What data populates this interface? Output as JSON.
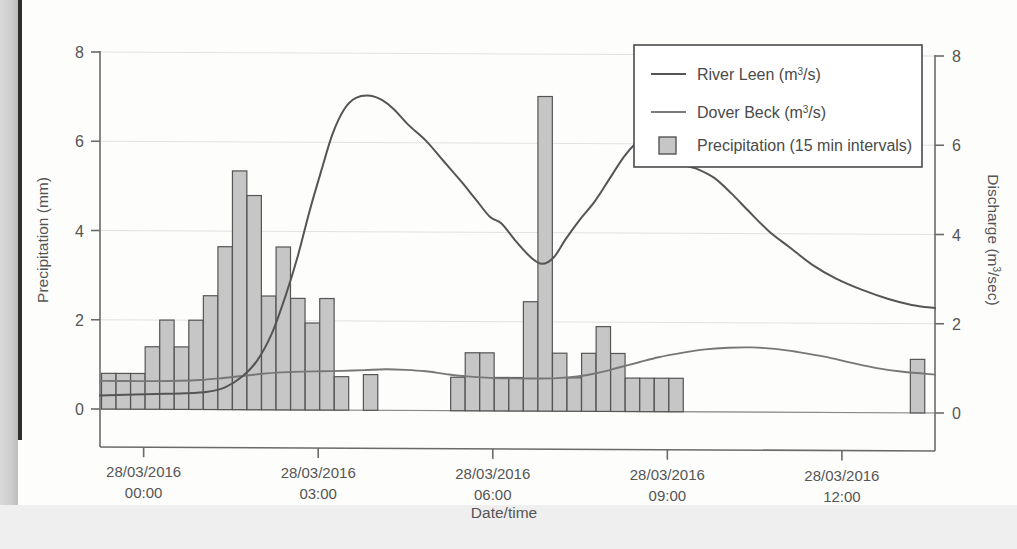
{
  "figure": {
    "name": "hydrograph-precipitation-discharge",
    "background_color": "#fdfdfc"
  },
  "chart_data": {
    "type": "bar",
    "title": "",
    "subtitle": "",
    "xlabel": "Date/time",
    "ylabel": "Precipitation (mm)",
    "y2label": "Discharge (m3/sec)",
    "ylim": [
      0,
      8
    ],
    "y2lim": [
      0,
      8
    ],
    "yticks": [
      "0",
      "2",
      "4",
      "6",
      "8"
    ],
    "y2ticks": [
      "0",
      "2",
      "4",
      "6",
      "8"
    ],
    "grid": true,
    "legend_position": "top-right",
    "xtick_labels": [
      {
        "date": "28/03/2016",
        "time": "00:00"
      },
      {
        "date": "28/03/2016",
        "time": "03:00"
      },
      {
        "date": "28/03/2016",
        "time": "06:00"
      },
      {
        "date": "28/03/2016",
        "time": "09:00"
      },
      {
        "date": "28/03/2016",
        "time": "12:00"
      }
    ],
    "xlim_hours": [
      -0.75,
      13.6
    ],
    "legend": [
      {
        "label": "River Leen (m3/s)",
        "label_pre": "River Leen (m",
        "label_sup": "3",
        "label_post": "/s)",
        "type": "line",
        "color": "#555555"
      },
      {
        "label": "Dover Beck (m3/s)",
        "label_pre": "Dover Beck (m",
        "label_sup": "3",
        "label_post": "/s)",
        "type": "line",
        "color": "#777777"
      },
      {
        "label": "Precipitation (15 min intervals)",
        "label_pre": "Precipitation (15 min intervals)",
        "label_sup": "",
        "label_post": "",
        "type": "bar",
        "color": "#c2c2c2"
      }
    ],
    "series": [
      {
        "name": "Precipitation (15 min intervals)",
        "units": "mm",
        "interval_minutes": 15,
        "type": "bar",
        "color": "#c6c6c6",
        "edge_color": "#555555",
        "points": [
          {
            "x": -0.6,
            "y": 0.8
          },
          {
            "x": -0.35,
            "y": 0.8
          },
          {
            "x": -0.1,
            "y": 0.8
          },
          {
            "x": 0.15,
            "y": 1.4
          },
          {
            "x": 0.4,
            "y": 2.0
          },
          {
            "x": 0.65,
            "y": 1.4
          },
          {
            "x": 0.9,
            "y": 2.0
          },
          {
            "x": 1.15,
            "y": 2.55
          },
          {
            "x": 1.4,
            "y": 3.65
          },
          {
            "x": 1.65,
            "y": 5.35
          },
          {
            "x": 1.9,
            "y": 4.8
          },
          {
            "x": 2.15,
            "y": 2.55
          },
          {
            "x": 2.4,
            "y": 3.65
          },
          {
            "x": 2.65,
            "y": 2.5
          },
          {
            "x": 2.9,
            "y": 1.95
          },
          {
            "x": 3.15,
            "y": 2.5
          },
          {
            "x": 3.4,
            "y": 0.75
          },
          {
            "x": 3.9,
            "y": 0.8
          },
          {
            "x": 5.4,
            "y": 0.75
          },
          {
            "x": 5.65,
            "y": 1.3
          },
          {
            "x": 5.9,
            "y": 1.3
          },
          {
            "x": 6.15,
            "y": 0.75
          },
          {
            "x": 6.4,
            "y": 0.75
          },
          {
            "x": 6.65,
            "y": 2.45
          },
          {
            "x": 6.9,
            "y": 7.05
          },
          {
            "x": 7.15,
            "y": 1.3
          },
          {
            "x": 7.4,
            "y": 0.75
          },
          {
            "x": 7.65,
            "y": 1.3
          },
          {
            "x": 7.9,
            "y": 1.9
          },
          {
            "x": 8.15,
            "y": 1.3
          },
          {
            "x": 8.4,
            "y": 0.75
          },
          {
            "x": 8.65,
            "y": 0.75
          },
          {
            "x": 8.9,
            "y": 0.75
          },
          {
            "x": 9.15,
            "y": 0.75
          },
          {
            "x": 13.3,
            "y": 1.2
          }
        ]
      },
      {
        "name": "River Leen (m3/s)",
        "units": "m3/s",
        "type": "line",
        "color": "#555555",
        "points": [
          {
            "x": -0.75,
            "y": 0.3
          },
          {
            "x": -0.3,
            "y": 0.32
          },
          {
            "x": 0.2,
            "y": 0.34
          },
          {
            "x": 0.7,
            "y": 0.36
          },
          {
            "x": 1.1,
            "y": 0.4
          },
          {
            "x": 1.4,
            "y": 0.5
          },
          {
            "x": 1.7,
            "y": 0.75
          },
          {
            "x": 1.95,
            "y": 1.1
          },
          {
            "x": 2.2,
            "y": 1.7
          },
          {
            "x": 2.45,
            "y": 2.6
          },
          {
            "x": 2.65,
            "y": 3.45
          },
          {
            "x": 2.85,
            "y": 4.45
          },
          {
            "x": 3.05,
            "y": 5.35
          },
          {
            "x": 3.25,
            "y": 6.2
          },
          {
            "x": 3.45,
            "y": 6.75
          },
          {
            "x": 3.65,
            "y": 7.0
          },
          {
            "x": 3.9,
            "y": 7.05
          },
          {
            "x": 4.1,
            "y": 6.95
          },
          {
            "x": 4.3,
            "y": 6.75
          },
          {
            "x": 4.55,
            "y": 6.4
          },
          {
            "x": 4.85,
            "y": 6.05
          },
          {
            "x": 5.15,
            "y": 5.6
          },
          {
            "x": 5.45,
            "y": 5.15
          },
          {
            "x": 5.7,
            "y": 4.75
          },
          {
            "x": 5.95,
            "y": 4.35
          },
          {
            "x": 6.15,
            "y": 4.2
          },
          {
            "x": 6.4,
            "y": 3.8
          },
          {
            "x": 6.65,
            "y": 3.45
          },
          {
            "x": 6.85,
            "y": 3.3
          },
          {
            "x": 7.05,
            "y": 3.45
          },
          {
            "x": 7.25,
            "y": 3.85
          },
          {
            "x": 7.5,
            "y": 4.3
          },
          {
            "x": 7.75,
            "y": 4.7
          },
          {
            "x": 8.0,
            "y": 5.2
          },
          {
            "x": 8.25,
            "y": 5.7
          },
          {
            "x": 8.45,
            "y": 6.0
          },
          {
            "x": 8.65,
            "y": 6.18
          },
          {
            "x": 8.85,
            "y": 6.1
          },
          {
            "x": 9.05,
            "y": 5.8
          },
          {
            "x": 9.25,
            "y": 5.55
          },
          {
            "x": 9.5,
            "y": 5.45
          },
          {
            "x": 9.8,
            "y": 5.25
          },
          {
            "x": 10.1,
            "y": 4.9
          },
          {
            "x": 10.4,
            "y": 4.5
          },
          {
            "x": 10.75,
            "y": 4.05
          },
          {
            "x": 11.1,
            "y": 3.7
          },
          {
            "x": 11.5,
            "y": 3.3
          },
          {
            "x": 11.9,
            "y": 3.0
          },
          {
            "x": 12.35,
            "y": 2.75
          },
          {
            "x": 12.8,
            "y": 2.55
          },
          {
            "x": 13.2,
            "y": 2.42
          },
          {
            "x": 13.6,
            "y": 2.35
          }
        ]
      },
      {
        "name": "Dover Beck (m3/s)",
        "units": "m3/s",
        "type": "line",
        "color": "#777777",
        "points": [
          {
            "x": -0.75,
            "y": 0.63
          },
          {
            "x": -0.25,
            "y": 0.63
          },
          {
            "x": 0.25,
            "y": 0.63
          },
          {
            "x": 0.6,
            "y": 0.64
          },
          {
            "x": 0.95,
            "y": 0.66
          },
          {
            "x": 1.3,
            "y": 0.7
          },
          {
            "x": 1.65,
            "y": 0.75
          },
          {
            "x": 2.0,
            "y": 0.8
          },
          {
            "x": 2.35,
            "y": 0.84
          },
          {
            "x": 2.7,
            "y": 0.86
          },
          {
            "x": 3.05,
            "y": 0.87
          },
          {
            "x": 3.4,
            "y": 0.88
          },
          {
            "x": 3.8,
            "y": 0.9
          },
          {
            "x": 4.15,
            "y": 0.92
          },
          {
            "x": 4.5,
            "y": 0.91
          },
          {
            "x": 4.85,
            "y": 0.88
          },
          {
            "x": 5.2,
            "y": 0.82
          },
          {
            "x": 5.55,
            "y": 0.77
          },
          {
            "x": 5.95,
            "y": 0.74
          },
          {
            "x": 6.35,
            "y": 0.73
          },
          {
            "x": 6.75,
            "y": 0.73
          },
          {
            "x": 7.1,
            "y": 0.74
          },
          {
            "x": 7.45,
            "y": 0.78
          },
          {
            "x": 7.8,
            "y": 0.86
          },
          {
            "x": 8.15,
            "y": 0.98
          },
          {
            "x": 8.5,
            "y": 1.1
          },
          {
            "x": 8.85,
            "y": 1.22
          },
          {
            "x": 9.25,
            "y": 1.32
          },
          {
            "x": 9.65,
            "y": 1.4
          },
          {
            "x": 10.05,
            "y": 1.44
          },
          {
            "x": 10.45,
            "y": 1.45
          },
          {
            "x": 10.85,
            "y": 1.42
          },
          {
            "x": 11.25,
            "y": 1.35
          },
          {
            "x": 11.7,
            "y": 1.25
          },
          {
            "x": 12.15,
            "y": 1.12
          },
          {
            "x": 12.6,
            "y": 1.0
          },
          {
            "x": 13.05,
            "y": 0.92
          },
          {
            "x": 13.6,
            "y": 0.86
          }
        ]
      }
    ]
  }
}
